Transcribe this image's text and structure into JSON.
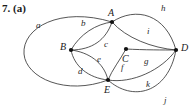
{
  "problem": {
    "number_label": "7. (a)"
  },
  "figure": {
    "type": "multigraph-diagram",
    "width": 193,
    "height": 108,
    "background_color": "#ffffff",
    "stroke_color": "#2b2b2b",
    "vertex_color": "#111111",
    "vertices": [
      {
        "id": "A",
        "label": "A",
        "x": 112,
        "y": 22,
        "label_x": 108,
        "label_y": 16
      },
      {
        "id": "B",
        "label": "B",
        "x": 71,
        "y": 50,
        "label_x": 60,
        "label_y": 50
      },
      {
        "id": "C",
        "label": "C",
        "x": 126,
        "y": 49,
        "label_x": 122,
        "label_y": 62
      },
      {
        "id": "D",
        "label": "D",
        "x": 176,
        "y": 50,
        "label_x": 181,
        "label_y": 51
      },
      {
        "id": "E",
        "label": "E",
        "x": 108,
        "y": 80,
        "label_x": 104,
        "label_y": 93
      }
    ],
    "edges": [
      {
        "id": "a",
        "label": "a",
        "from": "A",
        "to": "E",
        "label_x": 36,
        "label_y": 28,
        "path": "M 112 22 C 60 6 22 28 24 54 C 26 78 66 96 108 80"
      },
      {
        "id": "b",
        "label": "b",
        "from": "A",
        "to": "B",
        "label_x": 81,
        "label_y": 26,
        "path": "M 112 22 C 96 24 80 34 71 50"
      },
      {
        "id": "c",
        "label": "c",
        "from": "A",
        "to": "B",
        "label_x": 104,
        "label_y": 47,
        "path": "M 112 22 C 106 40 92 50 71 50"
      },
      {
        "id": "d",
        "label": "d",
        "from": "B",
        "to": "E",
        "label_x": 78,
        "label_y": 74,
        "path": "M 71 50 C 74 66 88 78 108 80"
      },
      {
        "id": "e",
        "label": "e",
        "from": "B",
        "to": "E",
        "label_x": 97,
        "label_y": 62,
        "path": "M 71 50 C 88 52 104 62 108 80"
      },
      {
        "id": "f",
        "label": "f",
        "from": "C",
        "to": "E",
        "label_x": 121,
        "label_y": 70,
        "path": "M 126 49 C 120 60 112 70 108 80"
      },
      {
        "id": "g",
        "label": "g",
        "from": "C",
        "to": "D",
        "label_x": 144,
        "label_y": 64,
        "path": "M 126 49 C 144 50 164 50 176 50"
      },
      {
        "id": "h",
        "label": "h",
        "from": "A",
        "to": "D",
        "label_x": 161,
        "label_y": 11,
        "path": "M 112 22 C 136 6 166 14 176 50"
      },
      {
        "id": "i",
        "label": "i",
        "from": "A",
        "to": "D",
        "label_x": 147,
        "label_y": 34,
        "path": "M 112 22 C 126 38 152 48 176 50"
      },
      {
        "id": "j",
        "label": "j",
        "from": "E",
        "to": "D",
        "label_x": 164,
        "label_y": 103,
        "path": "M 108 80 C 132 102 168 94 176 50"
      },
      {
        "id": "k",
        "label": "k",
        "from": "E",
        "to": "D",
        "label_x": 146,
        "label_y": 87,
        "path": "M 108 80 C 132 84 162 70 176 50"
      }
    ],
    "extra_arcs": [
      {
        "id": "outer-left",
        "path": "M 112 22 C 60 6 22 28 24 54 C 26 78 66 96 108 80"
      }
    ]
  }
}
